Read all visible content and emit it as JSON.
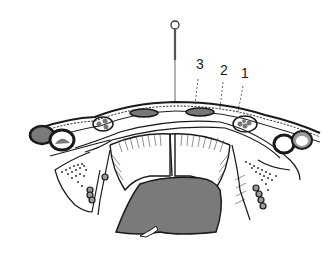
{
  "figure": {
    "type": "anatomical cross-section illustration",
    "labels": [
      {
        "id": "label-3",
        "text": "3",
        "x": 196,
        "y": 58
      },
      {
        "id": "label-2",
        "text": "2",
        "x": 220,
        "y": 63
      },
      {
        "id": "label-1",
        "text": "1",
        "x": 241,
        "y": 66
      }
    ],
    "colors": {
      "line": "#1a1a1a",
      "fill_gray": "#7a7a7a",
      "background": "#ffffff"
    },
    "elements": {
      "needle": "needle-with-eyelet",
      "central_cavity": "shaded-gray-cavity",
      "arrow": "white-arrow-in-cavity"
    }
  }
}
